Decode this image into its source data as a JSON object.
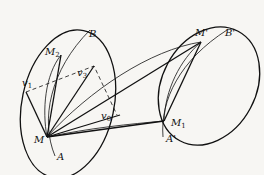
{
  "figure": {
    "type": "geometric-diagram",
    "colors": {
      "background": "#f7f6f3",
      "ink": "#111111"
    }
  },
  "labels": {
    "M": "M",
    "M2": "M",
    "M2_sub": "2",
    "B": "B",
    "A": "A",
    "v1": "v",
    "v1_sub": "1",
    "v3": "v",
    "v3_sub": "3",
    "v0": "v",
    "v0_sub": "0",
    "M_prime": "M'",
    "B_prime": "B'",
    "M1": "M",
    "M1_sub": "1",
    "A_prime": "A'"
  }
}
